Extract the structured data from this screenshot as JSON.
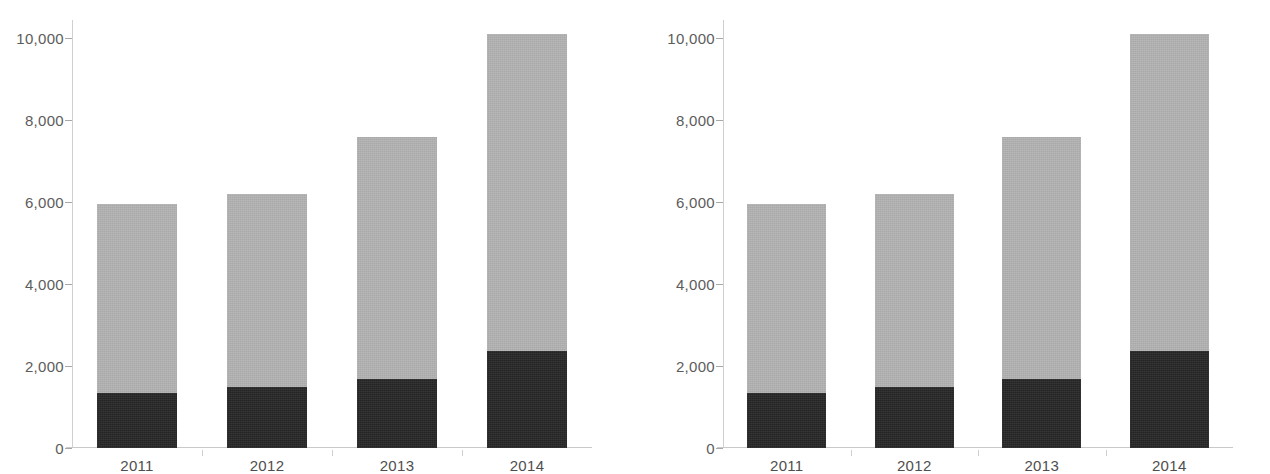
{
  "chart_data": [
    {
      "type": "bar",
      "subtype": "stacked",
      "panel": "left",
      "title": "",
      "subtitle": "",
      "xlabel": "",
      "ylabel": "",
      "categories": [
        "2011",
        "2012",
        "2013",
        "2014"
      ],
      "series": [
        {
          "name": "lower-segment",
          "color": "#262626",
          "values": [
            1350,
            1500,
            1680,
            2380
          ]
        },
        {
          "name": "upper-segment",
          "color": "#b2b2b2",
          "values": [
            4600,
            4700,
            5920,
            7720
          ]
        }
      ],
      "totals": [
        5950,
        6200,
        7600,
        10100
      ],
      "ylim": [
        0,
        10500
      ],
      "yticks": [
        0,
        2000,
        4000,
        6000,
        8000,
        10000
      ],
      "ytick_labels": [
        "0",
        "2,000",
        "4,000",
        "6,000",
        "8,000",
        "10,000"
      ],
      "grid": false,
      "legend": "none"
    },
    {
      "type": "bar",
      "subtype": "stacked",
      "panel": "right",
      "title": "",
      "subtitle": "",
      "xlabel": "",
      "ylabel": "",
      "categories": [
        "2011",
        "2012",
        "2013",
        "2014"
      ],
      "series": [
        {
          "name": "lower-segment",
          "color": "#262626",
          "values": [
            1350,
            1500,
            1680,
            2380
          ]
        },
        {
          "name": "upper-segment",
          "color": "#b2b2b2",
          "values": [
            4600,
            4700,
            5920,
            7720
          ]
        }
      ],
      "totals": [
        5950,
        6200,
        7600,
        10100
      ],
      "ylim": [
        0,
        10500
      ],
      "yticks": [
        0,
        2000,
        4000,
        6000,
        8000,
        10000
      ],
      "ytick_labels": [
        "0",
        "2,000",
        "4,000",
        "6,000",
        "8,000",
        "10,000"
      ],
      "grid": false,
      "legend": "none"
    }
  ],
  "colors": {
    "segment_dark": "#262626",
    "segment_light": "#b2b2b2",
    "axis": "#c9c9c9",
    "tick_text": "#5c5c5c",
    "background": "#ffffff"
  }
}
